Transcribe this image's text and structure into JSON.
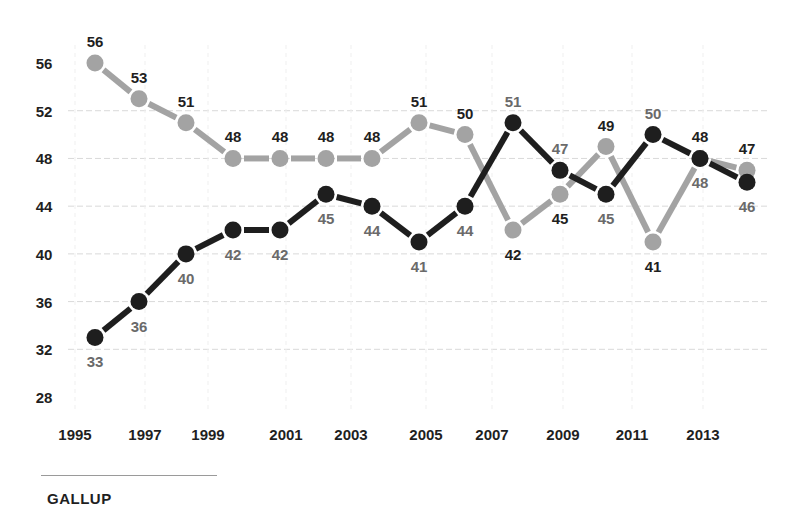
{
  "chart_data": {
    "type": "line",
    "title": "",
    "xlabel": "",
    "ylabel": "",
    "ylim": [
      28,
      56
    ],
    "yticks": [
      56,
      52,
      48,
      44,
      40,
      36,
      32,
      28
    ],
    "xtick_labels": [
      "1995",
      "1997",
      "1999",
      "2001",
      "2003",
      "2005",
      "2007",
      "2009",
      "2011",
      "2013"
    ],
    "grid": true,
    "legend": null,
    "n_points": 15,
    "series": [
      {
        "name": "light-gray series",
        "color": "#a3a3a3",
        "values": [
          56,
          53,
          51,
          48,
          48,
          48,
          48,
          51,
          50,
          42,
          45,
          49,
          41,
          48,
          47
        ]
      },
      {
        "name": "dark series",
        "color": "#1e1e1e",
        "values": [
          33,
          36,
          40,
          42,
          42,
          45,
          44,
          41,
          44,
          51,
          47,
          45,
          50,
          48,
          46
        ]
      }
    ],
    "source": "GALLUP"
  },
  "layout": {
    "point_x": [
      95,
      139,
      186,
      233,
      280,
      326,
      372,
      419,
      465,
      513,
      560,
      606,
      653,
      700,
      747
    ],
    "xtick_x": [
      75,
      145,
      208,
      286,
      351,
      426,
      492,
      563,
      632,
      703
    ],
    "light_label_pos": [
      "above",
      "above",
      "above",
      "above",
      "above",
      "above",
      "above",
      "above",
      "above",
      "below",
      "below",
      "above",
      "below",
      "above",
      "above"
    ],
    "dark_label_pos": [
      "below",
      "below",
      "below",
      "below",
      "below",
      "below",
      "below",
      "below",
      "below",
      "above",
      "above",
      "below",
      "above",
      "below",
      "below"
    ]
  },
  "footer": {
    "source": "GALLUP"
  }
}
